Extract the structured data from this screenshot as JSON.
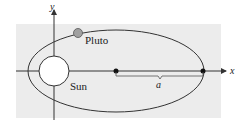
{
  "diagram": {
    "type": "orbit-ellipse",
    "colors": {
      "background_panel": "#ececec",
      "stroke": "#333333",
      "planet_fill": "#a0a0a0",
      "sun_fill": "#ffffff"
    },
    "labels": {
      "x_axis": "x",
      "y_axis": "y",
      "planet": "Pluto",
      "star": "Sun",
      "semi_major_axis": "a"
    }
  }
}
